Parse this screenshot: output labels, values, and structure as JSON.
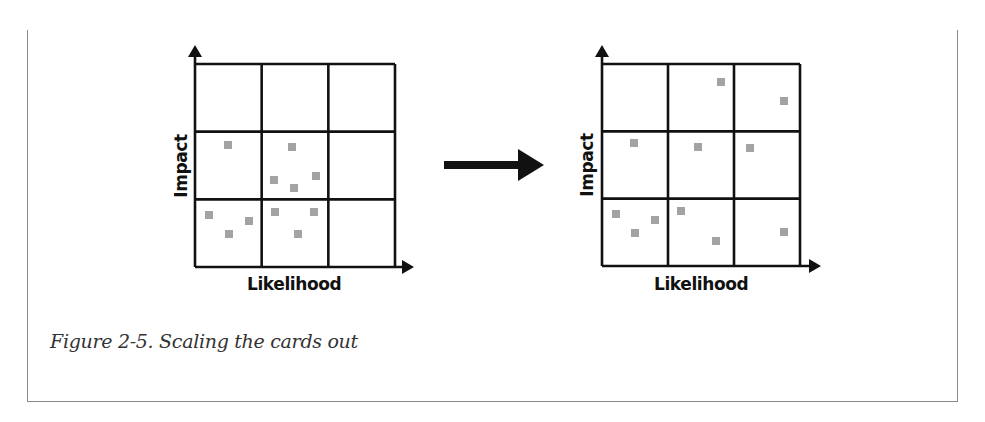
{
  "figure": {
    "caption": "Figure 2-5. Scaling the cards out",
    "transition": "right-arrow-icon",
    "colors": {
      "grid_line": "#111111",
      "card": "#a3a3a3",
      "frame_border": "#8a8a8a",
      "caption_text": "#333333"
    },
    "matrices": [
      {
        "id": "before",
        "x_axis_label": "Likelihood",
        "y_axis_label": "Impact",
        "rows": 3,
        "cols": 3
      },
      {
        "id": "after",
        "x_axis_label": "Likelihood",
        "y_axis_label": "Impact",
        "rows": 3,
        "cols": 3
      }
    ]
  },
  "chart_data": [
    {
      "type": "scatter",
      "title": "Before scaling",
      "xlabel": "Likelihood",
      "ylabel": "Impact",
      "grid": "3x3",
      "cell_counts_by_row_top_to_bottom": [
        [
          0,
          0,
          0
        ],
        [
          1,
          4,
          0
        ],
        [
          3,
          3,
          0
        ]
      ],
      "points_px": [
        [
          228,
          145
        ],
        [
          292,
          147
        ],
        [
          274,
          180
        ],
        [
          316,
          176
        ],
        [
          294,
          188
        ],
        [
          209,
          215
        ],
        [
          249,
          221
        ],
        [
          229,
          234
        ],
        [
          275,
          212
        ],
        [
          314,
          212
        ],
        [
          298,
          234
        ]
      ]
    },
    {
      "type": "scatter",
      "title": "After scaling",
      "xlabel": "Likelihood",
      "ylabel": "Impact",
      "grid": "3x3",
      "cell_counts_by_row_top_to_bottom": [
        [
          0,
          1,
          1
        ],
        [
          1,
          1,
          1
        ],
        [
          3,
          2,
          1
        ]
      ],
      "points_px": [
        [
          721,
          82
        ],
        [
          784,
          101
        ],
        [
          634,
          143
        ],
        [
          698,
          147
        ],
        [
          750,
          148
        ],
        [
          616,
          214
        ],
        [
          655,
          220
        ],
        [
          635,
          233
        ],
        [
          681,
          211
        ],
        [
          716,
          241
        ],
        [
          784,
          232
        ]
      ]
    }
  ]
}
